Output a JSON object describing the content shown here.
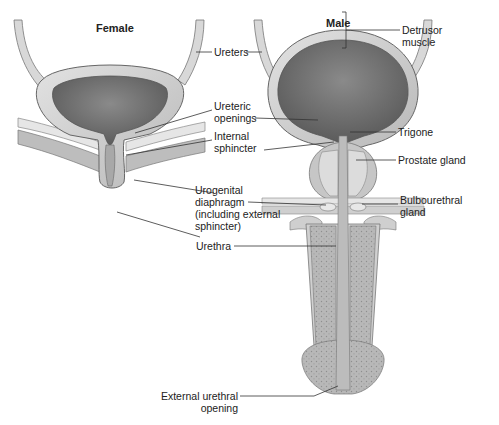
{
  "titles": {
    "female": "Female",
    "male": "Male"
  },
  "labels": {
    "ureters": "Ureters",
    "ureteric_openings": [
      "Ureteric",
      "openings"
    ],
    "internal_sphincter": [
      "Internal",
      "sphincter"
    ],
    "urogenital_diaphragm": [
      "Urogenital",
      "diaphragm",
      "(including external",
      "sphincter)"
    ],
    "urethra": "Urethra",
    "detrusor_muscle": [
      "Detrusor",
      "muscle"
    ],
    "trigone": "Trigone",
    "prostate_gland": "Prostate gland",
    "bulbourethral_gland": [
      "Bulbourethral",
      "gland"
    ],
    "external_urethral_opening": [
      "External urethral",
      "opening"
    ]
  },
  "colors": {
    "bladder_wall": "#d4d4d4",
    "bladder_wall_dark": "#9a9a9a",
    "bladder_lumen": "#6e6e6e",
    "tissue_light": "#cfcfcf",
    "erectile": "#b5b5b5",
    "line": "#333333",
    "text": "#222222"
  }
}
